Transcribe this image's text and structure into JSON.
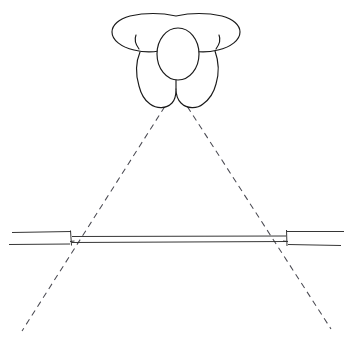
{
  "canvas": {
    "width": 352,
    "height": 342,
    "background_color": "#ffffff"
  },
  "diagram": {
    "title": "Overhead view of a person facing a horizontal bar with a dashed field-of-view cone",
    "line_color": "#1a1a1a",
    "dashed_line_color": "#4a4a52",
    "style": "hand-drawn line art, black ink on white, no labels"
  },
  "elements": {
    "person": {
      "name": "person-top-view",
      "head": {
        "shape": "ellipse",
        "cx": 178,
        "cy": 54,
        "rx": 21,
        "ry": 26
      },
      "arms": {
        "shape": "wide-boomerang-outline",
        "left_tip_x": 120,
        "right_tip_x": 240,
        "top_y": 13,
        "bottom_y": 52
      },
      "torso": {
        "shape": "tapered-body-outline",
        "left_x": 137,
        "right_x": 219,
        "top_y": 48,
        "bottom_y": 108
      },
      "feet": {
        "count": 2,
        "left_lobe_center_x": 157,
        "right_lobe_center_x": 197,
        "bottom_y": 107
      }
    },
    "sight_cone": {
      "name": "dashed-sight-lines",
      "apex_x": 176,
      "apex_y": 89,
      "left_end_x": 22,
      "left_end_y": 331,
      "right_end_x": 331,
      "right_end_y": 329,
      "dash_pattern": "6 4.5"
    },
    "bar_assembly": {
      "name": "horizontal-bar-structure",
      "left_post_x": 70,
      "right_post_x": 287,
      "post_top_y": 231,
      "post_bottom_y": 245,
      "beam_top_y": 236,
      "beam_bottom_y": 242,
      "left_rail_start_x": 12,
      "right_rail_end_x": 344,
      "rail_top_y": 232,
      "rail_bottom_y": 244
    }
  },
  "labels": {
    "none_visible": ""
  }
}
